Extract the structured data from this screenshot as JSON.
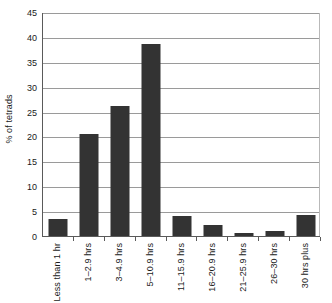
{
  "chart_data": {
    "type": "bar",
    "title": "",
    "subtitle": "",
    "xlabel": "",
    "ylabel": "% of tetrads",
    "categories": [
      "Less than 1 hr",
      "1–2.9 hrs",
      "3–4.9 hrs",
      "5–10.9 hrs",
      "11–15.9 hrs",
      "16–20.9 hrs",
      "21–25.9 hrs",
      "26–30 hrs",
      "30 hrs plus"
    ],
    "values": [
      3.5,
      20.5,
      26.1,
      38.5,
      4.0,
      2.3,
      0.7,
      1.0,
      4.2
    ],
    "ylim": [
      0,
      45
    ],
    "ytick_values": [
      0,
      5,
      10,
      15,
      20,
      25,
      30,
      35,
      40,
      45
    ],
    "ytick_labels": [
      "0",
      "5",
      "10",
      "15",
      "20",
      "25",
      "30",
      "35",
      "40",
      "45"
    ],
    "grid": true,
    "grid_axis": "y",
    "legend": false,
    "legend_position": "none",
    "bar_color": "#333333",
    "grid_color": "#9a9a9a",
    "axis_color": "#5a5a5a",
    "background_color": "#ffffff"
  }
}
